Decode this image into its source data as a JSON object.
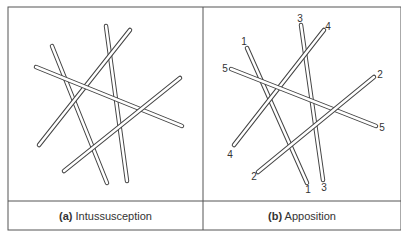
{
  "panels": [
    {
      "id": "a",
      "label_tag": "(a)",
      "label_text": "Intussusception",
      "rods": [
        {
          "x1": 52,
          "y1": 46,
          "x2": 107,
          "y2": 183
        },
        {
          "x1": 106,
          "y1": 26,
          "x2": 127,
          "y2": 181
        },
        {
          "x1": 130,
          "y1": 30,
          "x2": 39,
          "y2": 145
        },
        {
          "x1": 36,
          "y1": 67,
          "x2": 182,
          "y2": 126
        },
        {
          "x1": 180,
          "y1": 78,
          "x2": 64,
          "y2": 171
        }
      ]
    },
    {
      "id": "b",
      "label_tag": "(b)",
      "label_text": "Apposition",
      "rods": [
        {
          "id": "1",
          "x1": 247,
          "y1": 48,
          "x2": 307,
          "y2": 183
        },
        {
          "id": "3",
          "x1": 301,
          "y1": 25,
          "x2": 323,
          "y2": 180
        },
        {
          "id": "4",
          "x1": 324,
          "y1": 30,
          "x2": 234,
          "y2": 145
        },
        {
          "id": "5",
          "x1": 231,
          "y1": 69,
          "x2": 376,
          "y2": 126
        },
        {
          "id": "2",
          "x1": 374,
          "y1": 77,
          "x2": 258,
          "y2": 172
        }
      ],
      "end_labels": [
        {
          "text": "1",
          "x": 244,
          "y": 45
        },
        {
          "text": "1",
          "x": 308,
          "y": 193
        },
        {
          "text": "3",
          "x": 300,
          "y": 22
        },
        {
          "text": "3",
          "x": 324,
          "y": 191
        },
        {
          "text": "4",
          "x": 328,
          "y": 30
        },
        {
          "text": "4",
          "x": 230,
          "y": 158
        },
        {
          "text": "5",
          "x": 225,
          "y": 72
        },
        {
          "text": "5",
          "x": 382,
          "y": 131
        },
        {
          "text": "2",
          "x": 380,
          "y": 78
        },
        {
          "text": "2",
          "x": 254,
          "y": 180
        }
      ]
    }
  ],
  "colors": {
    "stroke": "#444444",
    "text": "#333333"
  }
}
